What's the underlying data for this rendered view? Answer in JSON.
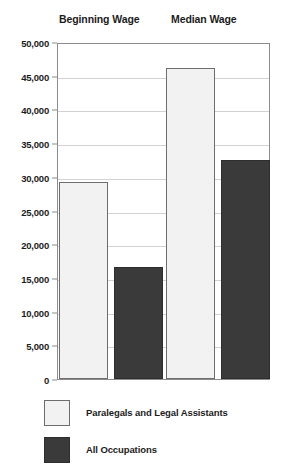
{
  "chart_data": {
    "type": "bar",
    "title": "",
    "xlabel": "",
    "ylabel": "",
    "ylim": [
      0,
      50000
    ],
    "grid": true,
    "legend_position": "bottom-left",
    "categories": [
      "Beginning Wage",
      "Median Wage"
    ],
    "ytick_labels": [
      "50,000",
      "45,000",
      "40,000",
      "35,000",
      "30,000",
      "25,000",
      "20,000",
      "15,000",
      "10,000",
      "5,000",
      "0"
    ],
    "ytick_values": [
      50000,
      45000,
      40000,
      35000,
      30000,
      25000,
      20000,
      15000,
      10000,
      5000,
      0
    ],
    "series": [
      {
        "name": "Paralegals and Legal Assistants",
        "color": "#f2f2f2",
        "values": [
          29300,
          46200
        ]
      },
      {
        "name": "All Occupations",
        "color": "#3a3a3a",
        "values": [
          16600,
          32500
        ]
      }
    ]
  }
}
